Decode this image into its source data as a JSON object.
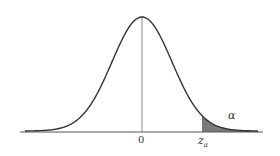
{
  "figure": {
    "type": "normal-distribution-upper-tail",
    "x_ticks": [
      {
        "label": "0"
      },
      {
        "label": "z",
        "subscript": "a"
      }
    ],
    "region_label": "α",
    "colors": {
      "curve": "#333333",
      "shade": "#7a7a7a",
      "axis": "#555555"
    }
  }
}
